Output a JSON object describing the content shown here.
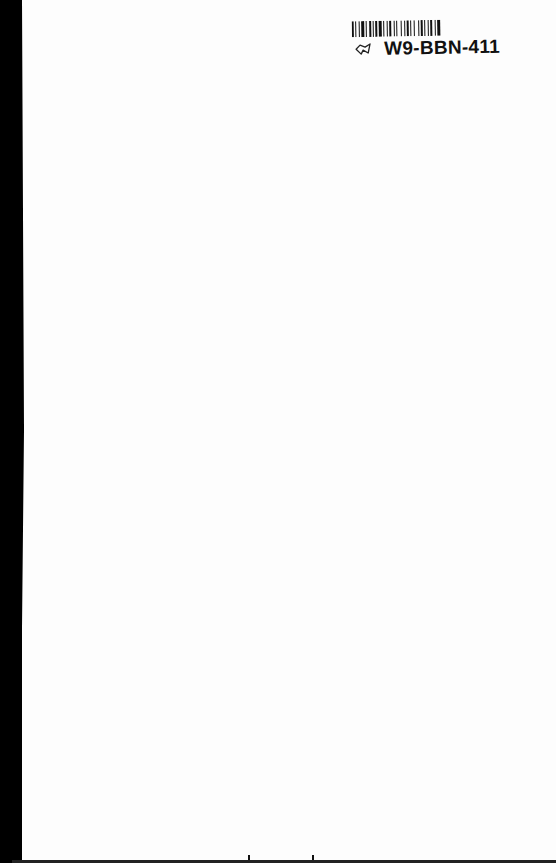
{
  "document": {
    "type": "scanned-page",
    "barcode_label": {
      "code": "W9-BBN-411",
      "icon": "hand-drawn-check-mark-icon"
    },
    "body_text": ""
  },
  "colors": {
    "paper": "#fdfdfd",
    "binding_edge": "#000000",
    "ink": "#111111"
  }
}
